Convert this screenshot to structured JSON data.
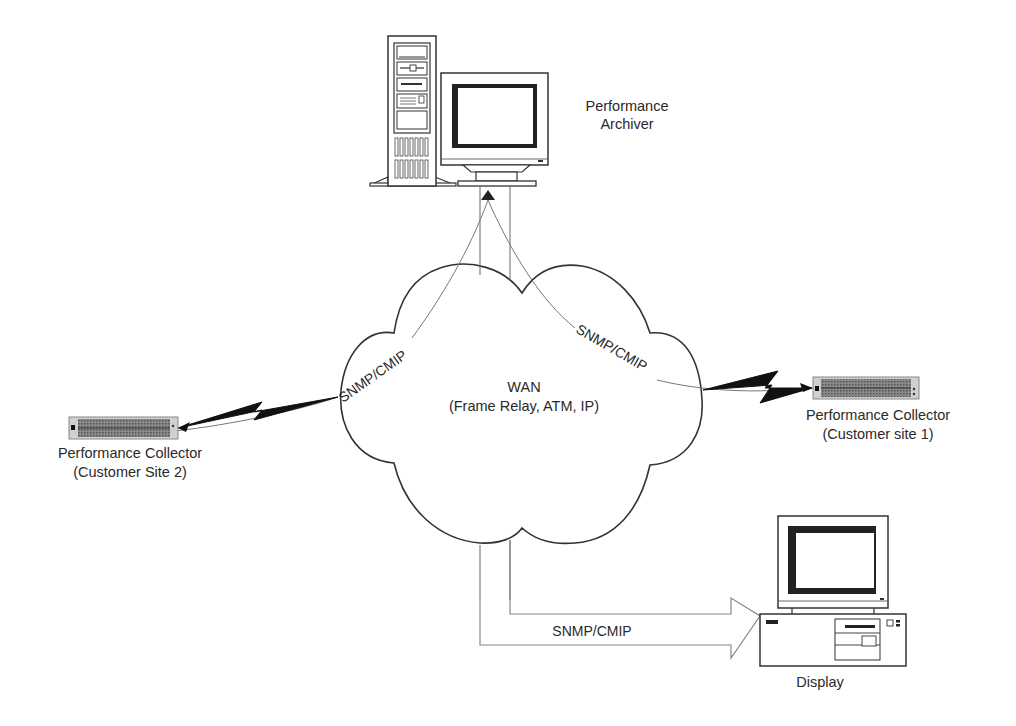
{
  "diagram": {
    "nodes": {
      "archiver": {
        "label_line1": "Performance",
        "label_line2": "Archiver"
      },
      "wan": {
        "label_line1": "WAN",
        "label_line2": "(Frame Relay, ATM, IP)"
      },
      "collector_site1": {
        "label_line1": "Performance Collector",
        "label_line2": "(Customer site 1)"
      },
      "collector_site2": {
        "label_line1": "Performance Collector",
        "label_line2": "(Customer Site 2)"
      },
      "display": {
        "label": "Display"
      }
    },
    "links": {
      "site2_to_archiver": {
        "protocol": "SNMP/CMIP"
      },
      "site1_to_archiver": {
        "protocol": "SNMP/CMIP"
      },
      "archiver_to_display": {
        "protocol": "SNMP/CMIP"
      }
    },
    "colors": {
      "stroke": "#333333",
      "thin_line": "#777777",
      "device_fill": "#7a7a7a",
      "background": "#ffffff"
    }
  }
}
